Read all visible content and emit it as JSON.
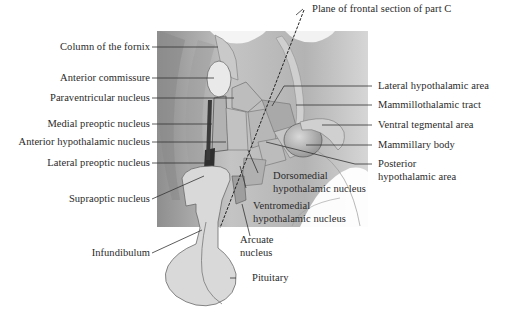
{
  "diagram": {
    "type": "anatomical-illustration",
    "colors": {
      "background": "#ffffff",
      "shaded_panel": "#b9b9b9",
      "pituitary_fill": "#d8d8d8",
      "leader_lines": "#333333",
      "text": "#2a2a2a"
    },
    "labels_left": [
      {
        "id": "column-of-the-fornix",
        "text": "Column of the fornix"
      },
      {
        "id": "anterior-commissure",
        "text": "Anterior commissure"
      },
      {
        "id": "paraventricular-nucleus",
        "text": "Paraventricular nucleus"
      },
      {
        "id": "medial-preoptic-nucleus",
        "text": "Medial preoptic nucleus"
      },
      {
        "id": "anterior-hypothalamic-nucleus",
        "text": "Anterior hypothalamic nucleus"
      },
      {
        "id": "lateral-preoptic-nucleus",
        "text": "Lateral preoptic nucleus"
      },
      {
        "id": "supraoptic-nucleus",
        "text": "Supraoptic nucleus"
      },
      {
        "id": "infundibulum",
        "text": "Infundibulum"
      }
    ],
    "labels_right": [
      {
        "id": "plane-of-frontal-section",
        "text": "Plane of frontal section of part C"
      },
      {
        "id": "lateral-hypothalamic-area",
        "text": "Lateral hypothalamic area"
      },
      {
        "id": "mammillothalamic-tract",
        "text": "Mammillothalamic tract"
      },
      {
        "id": "ventral-tegmental-area",
        "text": "Ventral tegmental area"
      },
      {
        "id": "mammillary-body",
        "text": "Mammillary body"
      },
      {
        "id": "posterior-hypothalamic-area",
        "line1": "Posterior",
        "line2": "hypothalamic area"
      }
    ],
    "labels_bottom": [
      {
        "id": "dorsomedial-hypothalamic-nucleus",
        "line1": "Dorsomedial",
        "line2": "hypothalamic nucleus"
      },
      {
        "id": "ventromedial-hypothalamic-nucleus",
        "line1": "Ventromedial",
        "line2": "hypothalamic nucleus"
      },
      {
        "id": "arcuate-nucleus",
        "line1": "Arcuate",
        "line2": "nucleus"
      },
      {
        "id": "pituitary",
        "text": "Pituitary"
      }
    ]
  }
}
